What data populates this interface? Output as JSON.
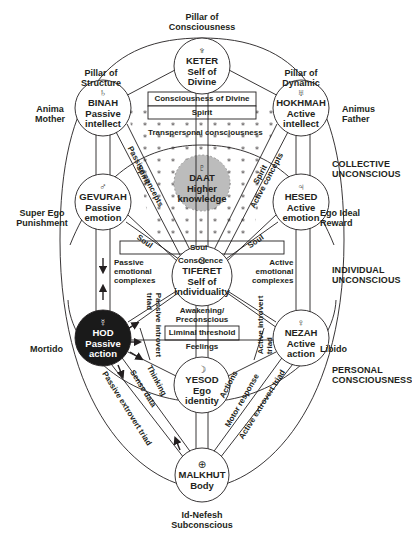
{
  "diagram": {
    "pillars": {
      "consciousness": "Pillar of\nConsciousness",
      "structure": "Pillar of\nStructure",
      "dynamic": "Pillar of\nDynamic"
    },
    "side_labels": {
      "anima": "Anima\nMother",
      "animus": "Animus\nFather",
      "super_ego": "Super Ego\nPunishment",
      "ego_ideal": "Ego Ideal\nReward",
      "mortido": "Mortido",
      "libido": "Libido",
      "id": "Id-Nefesh\nSubconscious"
    },
    "zones": {
      "collective": "COLLECTIVE\nUNCONSCIOUS",
      "individual": "INDIVIDUAL\nUNCONSCIOUS",
      "personal": "PERSONAL\nCONSCIOUSNESS"
    },
    "sephirot": {
      "keter": {
        "symbol": "♆",
        "name": "KETER",
        "desc": "Self of\nDivine"
      },
      "binah": {
        "symbol": "♄",
        "name": "BINAH",
        "desc": "Passive\nintellect"
      },
      "hokhmah": {
        "symbol": "♅",
        "name": "HOKHMAH",
        "desc": "Active\nintellect"
      },
      "daat": {
        "symbol": "♇",
        "name": "DAAT",
        "desc": "Higher\nknowledge"
      },
      "gevurah": {
        "symbol": "♂",
        "name": "GEVURAH",
        "desc": "Passive\nemotion"
      },
      "hesed": {
        "symbol": "♃",
        "name": "HESED",
        "desc": "Active\nemotion"
      },
      "tiferet": {
        "symbol": "⊙",
        "name": "TIFERET",
        "desc": "Self of\nindividuality"
      },
      "hod": {
        "symbol": "☿",
        "name": "HOD",
        "desc": "Passive\naction"
      },
      "nezah": {
        "symbol": "♀",
        "name": "NEZAH",
        "desc": "Active\naction"
      },
      "yesod": {
        "symbol": "☽",
        "name": "YESOD",
        "desc": "Ego\nidentity"
      },
      "malkhut": {
        "symbol": "⊕",
        "name": "MALKHUT",
        "desc": "Body"
      }
    },
    "paths": {
      "consciousness_of_divine": "Consciousness of Divine",
      "spirit_top": "Spirit",
      "transpersonal": "Transpersonal consciousness",
      "spirit_left": "Spirit",
      "spirit_right": "Spirit",
      "passive_concepts": "Passive concepts",
      "active_concepts": "Active concepts",
      "soul_mid": "Soul",
      "soul_left": "Soul",
      "soul_right": "Soul",
      "conscience": "Conscience",
      "passive_emotional": "Passive\nemotional\ncomplexes",
      "active_emotional": "Active\nemotional\ncomplexes",
      "awakening": "Awakening/\nPreconscious",
      "liminal": "Liminal threshold",
      "feelings": "Feelings",
      "passive_introvert": "Passive introvert\ntriad",
      "active_introvert": "Active introvert\ntriad",
      "thinking": "Thinking",
      "sense_data": "Sense data",
      "passive_extrovert": "Passive extrovert triad",
      "actions": "Actions",
      "motor_response": "Motor response",
      "active_extrovert": "Active extrovert triad"
    },
    "colors": {
      "line": "#231f20",
      "hod_fill": "#1a1a1a",
      "daat_fill": "#bcbcbc",
      "background": "#ffffff"
    }
  }
}
